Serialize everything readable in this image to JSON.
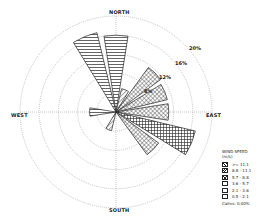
{
  "chart_data": {
    "type": "windrose",
    "title": "",
    "directions": [
      "NORTH",
      "EAST",
      "SOUTH",
      "WEST"
    ],
    "ring_labels": [
      "4%",
      "8%",
      "12%",
      "16%",
      "20%"
    ],
    "rmax_percent": 20,
    "legend_title": "WIND SPEED",
    "legend_unit": "(m/s)",
    "speed_bins": [
      ">= 11.1",
      "8.8 - 11.1",
      "5.7 - 8.8",
      "3.6 - 5.7",
      "2.1 - 3.6",
      "0.5 - 2.1"
    ],
    "calms": "Calms: 0.00%",
    "sectors": [
      {
        "dir_deg": 0,
        "total_percent": 16.0,
        "dominant_bin": "3.6 - 5.7"
      },
      {
        "dir_deg": 22.5,
        "total_percent": 5.0,
        "dominant_bin": "8.8 - 11.1"
      },
      {
        "dir_deg": 45,
        "total_percent": 11.5,
        "dominant_bin": "5.7 - 8.8"
      },
      {
        "dir_deg": 67.5,
        "total_percent": 11.0,
        "dominant_bin": "5.7 - 8.8"
      },
      {
        "dir_deg": 90,
        "total_percent": 11.0,
        "dominant_bin": "5.7 - 8.8"
      },
      {
        "dir_deg": 112.5,
        "total_percent": 17.0,
        "dominant_bin": "0.5 - 2.1"
      },
      {
        "dir_deg": 135,
        "total_percent": 11.0,
        "dominant_bin": "5.7 - 8.8"
      },
      {
        "dir_deg": 157.5,
        "total_percent": 0,
        "dominant_bin": ""
      },
      {
        "dir_deg": 180,
        "total_percent": 0,
        "dominant_bin": ""
      },
      {
        "dir_deg": 202.5,
        "total_percent": 4.0,
        "dominant_bin": "8.8 - 11.1"
      },
      {
        "dir_deg": 225,
        "total_percent": 0,
        "dominant_bin": ""
      },
      {
        "dir_deg": 247.5,
        "total_percent": 0,
        "dominant_bin": ""
      },
      {
        "dir_deg": 270,
        "total_percent": 5.5,
        "dominant_bin": "3.6 - 5.7"
      },
      {
        "dir_deg": 292.5,
        "total_percent": 0,
        "dominant_bin": ""
      },
      {
        "dir_deg": 315,
        "total_percent": 0,
        "dominant_bin": ""
      },
      {
        "dir_deg": 337.5,
        "total_percent": 17.0,
        "dominant_bin": "3.6 - 5.7"
      }
    ]
  }
}
